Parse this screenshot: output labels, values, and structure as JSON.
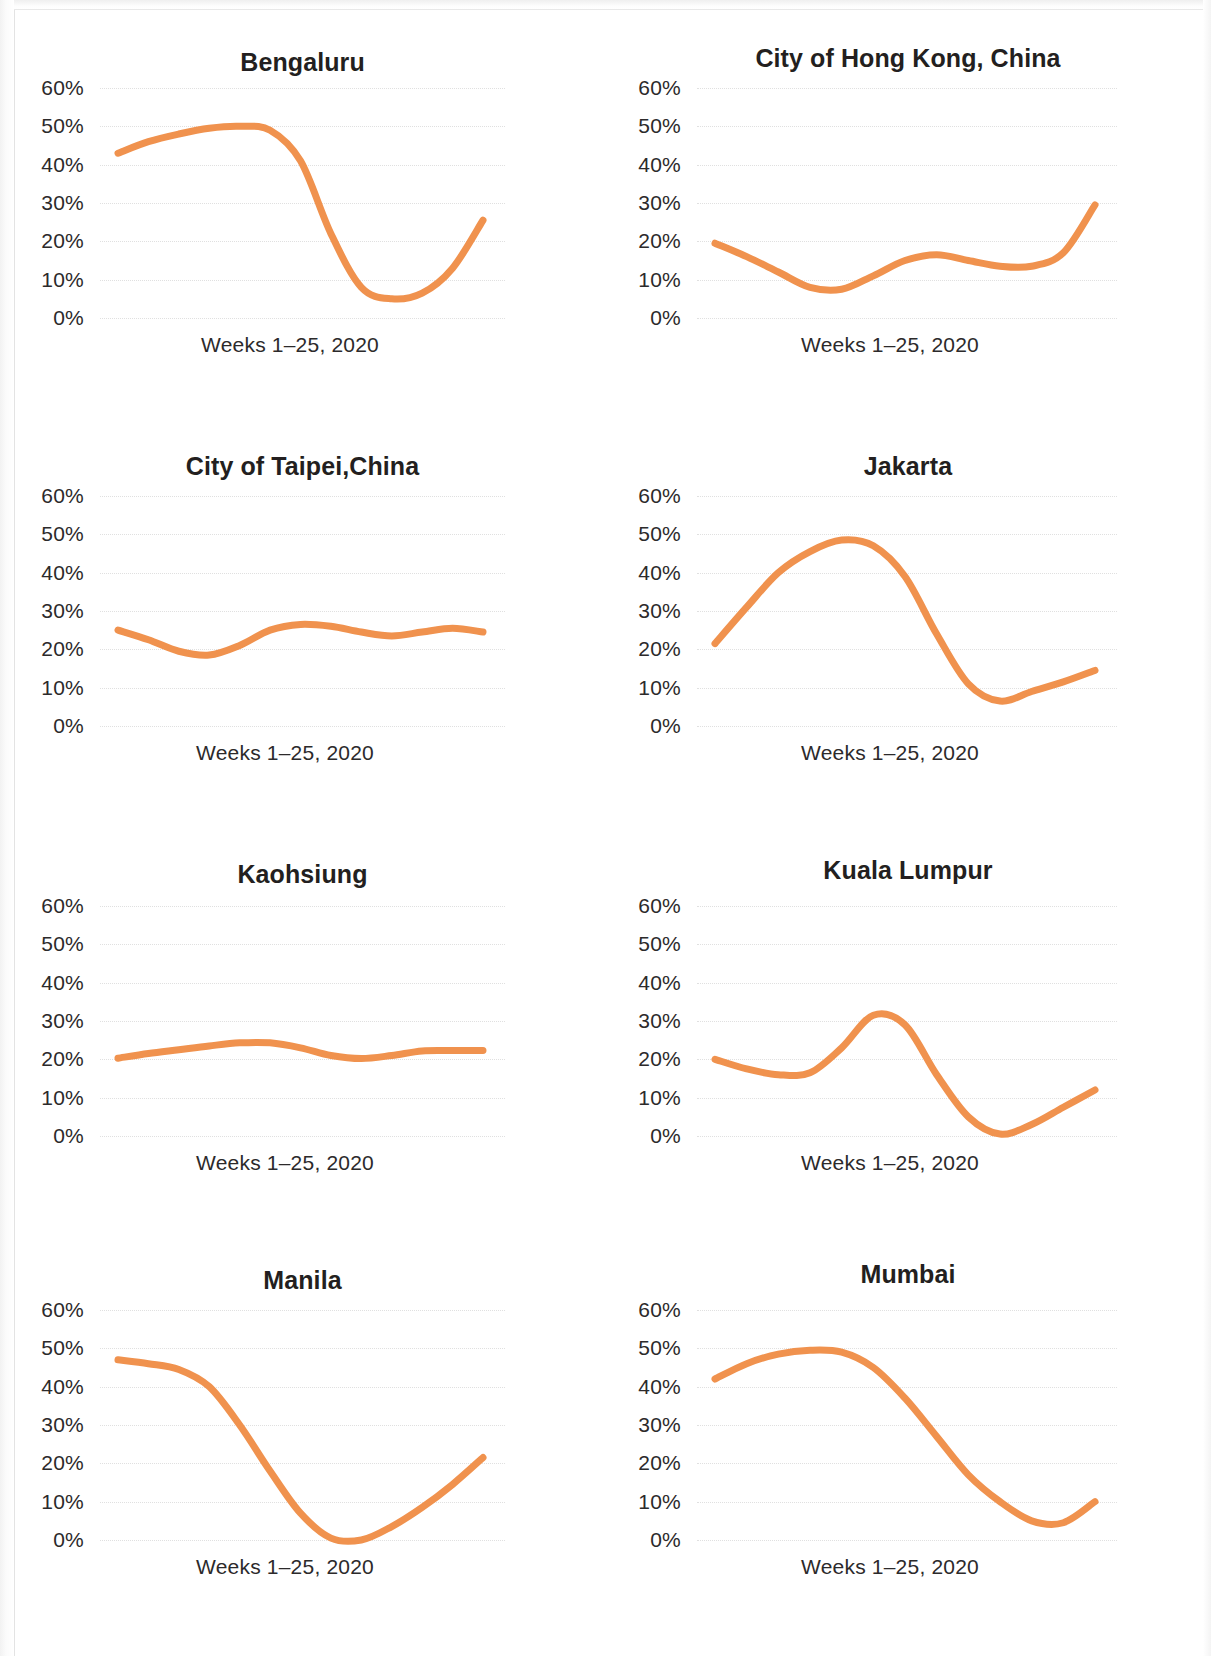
{
  "figure": {
    "background_color": "#ffffff",
    "accent_color": "#F0924E",
    "text_color": "#231f20",
    "gridline_color": "#d6d6d6",
    "y_tick_labels": [
      "60%",
      "50%",
      "40%",
      "30%",
      "20%",
      "10%",
      "0%"
    ],
    "x_axis_label": "Weeks 1–25, 2020"
  },
  "panels": [
    {
      "id": "bengaluru",
      "title": "Bengaluru"
    },
    {
      "id": "hongkong",
      "title": "City of Hong Kong, China"
    },
    {
      "id": "taipei",
      "title": "City of Taipei,China"
    },
    {
      "id": "jakarta",
      "title": "Jakarta"
    },
    {
      "id": "kaohsiung",
      "title": "Kaohsiung"
    },
    {
      "id": "kualalumpur",
      "title": "Kuala Lumpur"
    },
    {
      "id": "manila",
      "title": "Manila"
    },
    {
      "id": "mumbai",
      "title": "Mumbai"
    }
  ],
  "chart_data": [
    {
      "type": "line",
      "title": "Bengaluru",
      "xlabel": "Weeks 1–25, 2020",
      "ylabel": "",
      "ylim": [
        0,
        60
      ],
      "yticks": [
        0,
        10,
        20,
        30,
        40,
        50,
        60
      ],
      "ytick_labels": [
        "0%",
        "10%",
        "20%",
        "30%",
        "40%",
        "50%",
        "60%"
      ],
      "xlim": [
        1,
        25
      ],
      "grid": true,
      "legend": "none",
      "line_color": "#F0924E",
      "x": [
        1,
        3,
        5,
        7,
        9,
        11,
        13,
        15,
        17,
        19,
        21,
        23,
        25
      ],
      "values": [
        43,
        46,
        48,
        49.5,
        50,
        49,
        41,
        22,
        8,
        5,
        6.5,
        13,
        25.5
      ]
    },
    {
      "type": "line",
      "title": "City of Hong Kong, China",
      "xlabel": "Weeks 1–25, 2020",
      "ylabel": "",
      "ylim": [
        0,
        60
      ],
      "yticks": [
        0,
        10,
        20,
        30,
        40,
        50,
        60
      ],
      "ytick_labels": [
        "0%",
        "10%",
        "20%",
        "30%",
        "40%",
        "50%",
        "60%"
      ],
      "xlim": [
        1,
        25
      ],
      "grid": true,
      "legend": "none",
      "line_color": "#F0924E",
      "x": [
        1,
        3,
        5,
        7,
        9,
        11,
        13,
        15,
        17,
        19,
        21,
        23,
        25
      ],
      "values": [
        19.5,
        16,
        12,
        8,
        7.5,
        11,
        15,
        16.5,
        15,
        13.5,
        13.5,
        17,
        29.5
      ]
    },
    {
      "type": "line",
      "title": "City of Taipei,China",
      "xlabel": "Weeks 1–25, 2020",
      "ylabel": "",
      "ylim": [
        0,
        60
      ],
      "yticks": [
        0,
        10,
        20,
        30,
        40,
        50,
        60
      ],
      "ytick_labels": [
        "0%",
        "10%",
        "20%",
        "30%",
        "40%",
        "50%",
        "60%"
      ],
      "xlim": [
        1,
        25
      ],
      "grid": true,
      "legend": "none",
      "line_color": "#F0924E",
      "x": [
        1,
        3,
        5,
        7,
        9,
        11,
        13,
        15,
        17,
        19,
        21,
        23,
        25
      ],
      "values": [
        25,
        22.5,
        19.5,
        18.5,
        21,
        25,
        26.5,
        26,
        24.5,
        23.5,
        24.5,
        25.5,
        24.5
      ]
    },
    {
      "type": "line",
      "title": "Jakarta",
      "xlabel": "Weeks 1–25, 2020",
      "ylabel": "",
      "ylim": [
        0,
        60
      ],
      "yticks": [
        0,
        10,
        20,
        30,
        40,
        50,
        60
      ],
      "ytick_labels": [
        "0%",
        "10%",
        "20%",
        "30%",
        "40%",
        "50%",
        "60%"
      ],
      "xlim": [
        1,
        25
      ],
      "grid": true,
      "legend": "none",
      "line_color": "#F0924E",
      "x": [
        1,
        3,
        5,
        7,
        9,
        11,
        13,
        15,
        17,
        19,
        21,
        23,
        25
      ],
      "values": [
        21.5,
        31,
        40,
        45.5,
        48.5,
        47,
        39,
        24,
        11,
        6.5,
        9,
        11.5,
        14.5
      ]
    },
    {
      "type": "line",
      "title": "Kaohsiung",
      "xlabel": "Weeks 1–25, 2020",
      "ylabel": "",
      "ylim": [
        0,
        60
      ],
      "yticks": [
        0,
        10,
        20,
        30,
        40,
        50,
        60
      ],
      "ytick_labels": [
        "0%",
        "10%",
        "20%",
        "30%",
        "40%",
        "50%",
        "60%"
      ],
      "xlim": [
        1,
        25
      ],
      "grid": true,
      "legend": "none",
      "line_color": "#F0924E",
      "x": [
        1,
        3,
        5,
        7,
        9,
        11,
        13,
        15,
        17,
        19,
        21,
        23,
        25
      ],
      "values": [
        20.3,
        21.5,
        22.5,
        23.5,
        24.3,
        24.3,
        23,
        21,
        20.2,
        21,
        22.2,
        22.3,
        22.3
      ]
    },
    {
      "type": "line",
      "title": "Kuala Lumpur",
      "xlabel": "Weeks 1–25, 2020",
      "ylabel": "",
      "ylim": [
        0,
        60
      ],
      "yticks": [
        0,
        10,
        20,
        30,
        40,
        50,
        60
      ],
      "ytick_labels": [
        "0%",
        "10%",
        "20%",
        "30%",
        "40%",
        "50%",
        "60%"
      ],
      "xlim": [
        1,
        25
      ],
      "grid": true,
      "legend": "none",
      "line_color": "#F0924E",
      "x": [
        1,
        3,
        5,
        7,
        9,
        11,
        13,
        15,
        17,
        19,
        21,
        23,
        25
      ],
      "values": [
        20,
        17.5,
        16,
        16.5,
        23,
        31.5,
        29,
        16,
        5,
        0.5,
        3,
        7.5,
        12
      ]
    },
    {
      "type": "line",
      "title": "Manila",
      "xlabel": "Weeks 1–25, 2020",
      "ylabel": "",
      "ylim": [
        0,
        60
      ],
      "yticks": [
        0,
        10,
        20,
        30,
        40,
        50,
        60
      ],
      "ytick_labels": [
        "0%",
        "10%",
        "20%",
        "30%",
        "40%",
        "50%",
        "60%"
      ],
      "xlim": [
        1,
        25
      ],
      "grid": true,
      "legend": "none",
      "line_color": "#F0924E",
      "x": [
        1,
        3,
        5,
        7,
        9,
        11,
        13,
        15,
        17,
        19,
        21,
        23,
        25
      ],
      "values": [
        47,
        46,
        44.5,
        40,
        30,
        18,
        7,
        0.5,
        0,
        3.5,
        8.5,
        14.5,
        21.5
      ]
    },
    {
      "type": "line",
      "title": "Mumbai",
      "xlabel": "Weeks 1–25, 2020",
      "ylabel": "",
      "ylim": [
        0,
        60
      ],
      "yticks": [
        0,
        10,
        20,
        30,
        40,
        50,
        60
      ],
      "ytick_labels": [
        "0%",
        "10%",
        "20%",
        "30%",
        "40%",
        "50%",
        "60%"
      ],
      "xlim": [
        1,
        25
      ],
      "grid": true,
      "legend": "none",
      "line_color": "#F0924E",
      "x": [
        1,
        3,
        5,
        7,
        9,
        11,
        13,
        15,
        17,
        19,
        21,
        23,
        25
      ],
      "values": [
        42,
        46,
        48.5,
        49.5,
        49,
        45,
        37,
        27,
        17,
        10,
        5,
        4.5,
        10
      ]
    }
  ]
}
